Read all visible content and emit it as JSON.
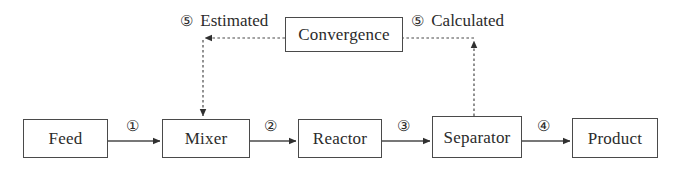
{
  "figure": {
    "kind": "process-flowsheet-diagram",
    "background_color": "#ffffff",
    "line_color": "#4a4a4a",
    "text_color": "#2b2b2b",
    "width": 676,
    "height": 175
  },
  "units": [
    {
      "id": "feed",
      "label": "Feed",
      "x": 23,
      "y": 119,
      "w": 85,
      "h": 39
    },
    {
      "id": "mixer",
      "label": "Mixer",
      "x": 162,
      "y": 119,
      "w": 88,
      "h": 39
    },
    {
      "id": "reactor",
      "label": "Reactor",
      "x": 298,
      "y": 119,
      "w": 84,
      "h": 39
    },
    {
      "id": "separator",
      "label": "Separator",
      "x": 432,
      "y": 116,
      "w": 90,
      "h": 42
    },
    {
      "id": "product",
      "label": "Product",
      "x": 572,
      "y": 118,
      "w": 86,
      "h": 40
    },
    {
      "id": "convergence",
      "label": "Convergence",
      "x": 285,
      "y": 17,
      "w": 118,
      "h": 35
    }
  ],
  "streams": [
    {
      "id": "stream-1",
      "tag": "①",
      "from": "feed",
      "to": "mixer",
      "style": "solid",
      "tag_x": 126,
      "tag_y": 119
    },
    {
      "id": "stream-2",
      "tag": "②",
      "from": "mixer",
      "to": "reactor",
      "style": "solid",
      "tag_x": 264,
      "tag_y": 119
    },
    {
      "id": "stream-3",
      "tag": "③",
      "from": "reactor",
      "to": "separator",
      "style": "solid",
      "tag_x": 397,
      "tag_y": 119
    },
    {
      "id": "stream-4",
      "tag": "④",
      "from": "separator",
      "to": "product",
      "style": "solid",
      "tag_x": 537,
      "tag_y": 119
    }
  ],
  "loop": {
    "estimated": {
      "tag": "⑤",
      "label": "Estimated",
      "x": 180,
      "y": 12
    },
    "calculated": {
      "tag": "⑤",
      "label": "Calculated",
      "x": 411,
      "y": 12
    },
    "style": "dashed",
    "estimated_target": "mixer",
    "calculated_source": "separator"
  }
}
